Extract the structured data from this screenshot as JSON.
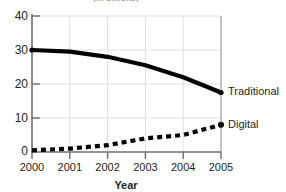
{
  "title_clipped": "(in billions)",
  "chart_data": {
    "type": "line",
    "title": "(in billions)",
    "xlabel": "Year",
    "ylabel": "",
    "categories": [
      "2000",
      "2001",
      "2002",
      "2003",
      "2004",
      "2005"
    ],
    "x": [
      2000,
      2001,
      2002,
      2003,
      2004,
      2005
    ],
    "xlim": [
      2000,
      2005
    ],
    "ylim": [
      0,
      40
    ],
    "yticks": [
      "0",
      "10",
      "20",
      "30",
      "40"
    ],
    "ytick_values": [
      0,
      10,
      20,
      30,
      40
    ],
    "grid": true,
    "legend_position": "inline-right",
    "series": [
      {
        "name": "Traditional",
        "style": "solid",
        "color": "#000000",
        "values": [
          30,
          29.5,
          28,
          25.5,
          22,
          17.5
        ]
      },
      {
        "name": "Digital",
        "style": "dashed",
        "color": "#000000",
        "values": [
          0.5,
          1,
          2,
          4,
          5,
          8
        ]
      }
    ]
  },
  "axis": {
    "x_label": "Year"
  },
  "labels": {
    "traditional": "Traditional",
    "digital": "Digital"
  },
  "ticks": {
    "y": [
      "40",
      "30",
      "20",
      "10",
      "0"
    ],
    "x": [
      "2000",
      "2001",
      "2002",
      "2003",
      "2004",
      "2005"
    ]
  }
}
